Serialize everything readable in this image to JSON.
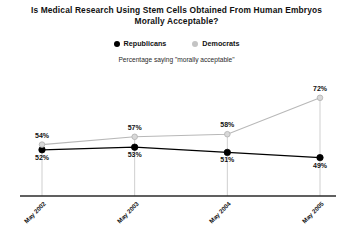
{
  "chart_data": {
    "type": "line",
    "title": "Is Medical Research Using Stem Cells Obtained From Human Embryos Morally Acceptable?",
    "title_lines": [
      "Is Medical Research Using Stem Cells Obtained From Human Embryos",
      "Morally Acceptable?"
    ],
    "subtitle": "Percentage saying \"morally acceptable\"",
    "xlabel": "",
    "ylabel": "",
    "categories": [
      "May 2002",
      "May 2003",
      "May 2004",
      "May 2005"
    ],
    "ylim": [
      45,
      75
    ],
    "grid": false,
    "legend_position": "top",
    "series": [
      {
        "name": "Republicans",
        "color": "#000000",
        "marker": "filled-circle",
        "values": [
          52,
          53,
          51,
          49
        ],
        "labels": [
          "52%",
          "53%",
          "51%",
          "49%"
        ]
      },
      {
        "name": "Democrats",
        "color": "#b8b8b8",
        "marker": "open-circle",
        "values": [
          54,
          57,
          58,
          72
        ],
        "labels": [
          "54%",
          "57%",
          "58%",
          "72%"
        ]
      }
    ]
  },
  "axis": {
    "tick_labels": [
      "May 2002",
      "May 2003",
      "May 2004",
      "May 2005"
    ]
  },
  "legend": {
    "entries": [
      {
        "label": "Republicans",
        "color": "#000000"
      },
      {
        "label": "Democrats",
        "color": "#c4c4c4"
      }
    ]
  },
  "colors": {
    "republican": "#000000",
    "democrat": "#b8b8b8",
    "axis": "#2b2b2b",
    "dropline": "#cfcfcf",
    "background": "#ffffff"
  }
}
